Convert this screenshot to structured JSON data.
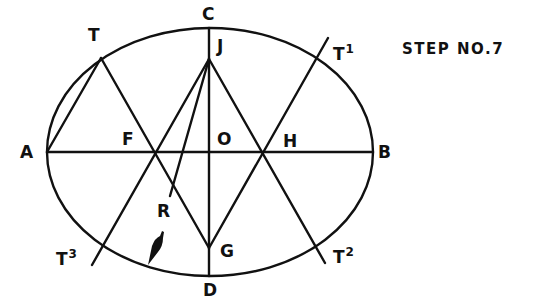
{
  "title": "STEP NO.7",
  "labels": {
    "A": "A",
    "B": "B",
    "C": "C",
    "D": "D",
    "O": "O",
    "F": "F",
    "H": "H",
    "J": "J",
    "G": "G",
    "R": "R",
    "T": "T",
    "T1_base": "T",
    "T1_sup": "1",
    "T2_base": "T",
    "T2_sup": "2",
    "T3_base": "T",
    "T3_sup": "3"
  },
  "geometry": {
    "ellipse": {
      "cx": 210,
      "cy": 152,
      "rx": 163,
      "ry": 124
    },
    "points": {
      "A": [
        47,
        152
      ],
      "B": [
        373,
        152
      ],
      "C": [
        209,
        28
      ],
      "D": [
        209,
        276
      ],
      "O": [
        209,
        152
      ],
      "F": [
        155,
        152
      ],
      "H": [
        266,
        152
      ],
      "J": [
        209,
        59
      ],
      "G": [
        209,
        248
      ],
      "T": [
        101,
        58
      ],
      "T1": [
        316,
        58
      ],
      "T2": [
        316,
        246
      ],
      "T3": [
        103,
        247
      ],
      "R": [
        170,
        196
      ]
    }
  },
  "colors": {
    "ink": "#111111",
    "paper": "#ffffff"
  }
}
